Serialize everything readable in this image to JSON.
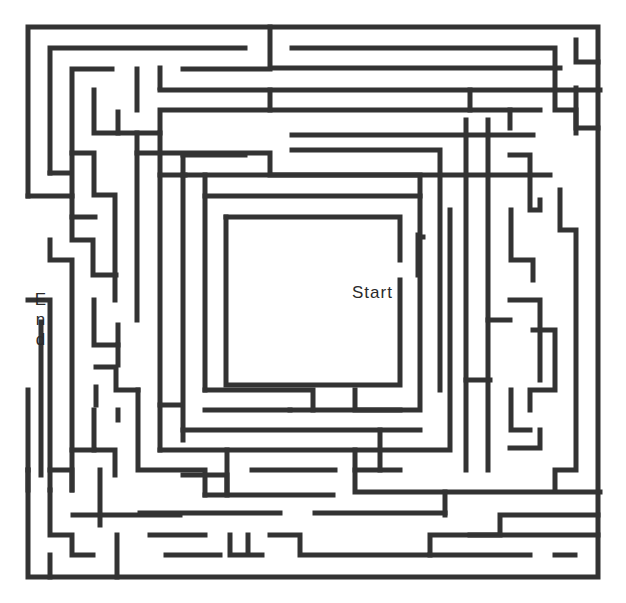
{
  "puzzle": {
    "type": "maze",
    "start_label": "Start",
    "end_label": "End",
    "end_letters": [
      "E",
      "n",
      "d"
    ],
    "wall_color": "#333333",
    "background_color": "#ffffff"
  }
}
